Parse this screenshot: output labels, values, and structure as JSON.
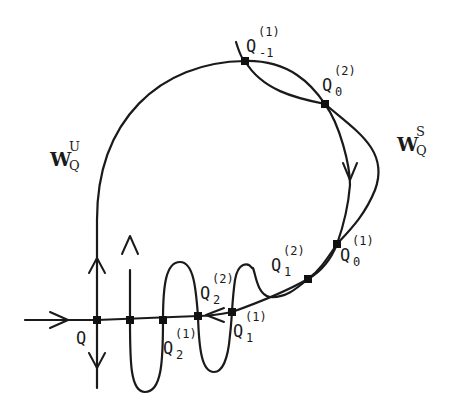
{
  "figure": {
    "type": "homoclinic tangle diagram",
    "manifolds": {
      "unstable": {
        "base": "W",
        "sub": "Q",
        "sup": "U"
      },
      "stable": {
        "base": "W",
        "sub": "Q",
        "sup": "S"
      }
    },
    "points": [
      {
        "id": "Q",
        "base": "Q",
        "sub": "",
        "sup": ""
      },
      {
        "id": "Q2_1",
        "base": "Q",
        "sub": "2",
        "sup": "(1)"
      },
      {
        "id": "Q2_2",
        "base": "Q",
        "sub": "2",
        "sup": "(2)"
      },
      {
        "id": "Q1_1",
        "base": "Q",
        "sub": "1",
        "sup": "(1)"
      },
      {
        "id": "Q1_2",
        "base": "Q",
        "sub": "1",
        "sup": "(2)"
      },
      {
        "id": "Q0_1",
        "base": "Q",
        "sub": "0",
        "sup": "(1)"
      },
      {
        "id": "Q0_2",
        "base": "Q",
        "sub": "0",
        "sup": "(2)"
      },
      {
        "id": "Qm1_1",
        "base": "Q",
        "sub": "-1",
        "sup": "(1)"
      }
    ]
  }
}
